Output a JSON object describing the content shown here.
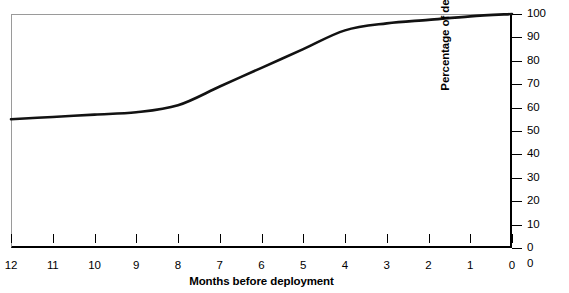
{
  "chart_data": {
    "type": "line",
    "title": "",
    "xlabel": "Months before deployment",
    "ylabel": "Percentage of deployers",
    "x": [
      12,
      11,
      10,
      9,
      8,
      7,
      6,
      5,
      4,
      3,
      2,
      1,
      0
    ],
    "values": [
      55,
      56,
      57,
      58,
      61,
      69,
      77,
      85,
      93,
      96,
      97.5,
      99,
      100
    ],
    "series": [
      {
        "name": "Percentage of deployers",
        "values": [
          55,
          56,
          57,
          58,
          61,
          69,
          77,
          85,
          93,
          96,
          97.5,
          99,
          100
        ]
      }
    ],
    "xlim": [
      12,
      0
    ],
    "ylim": [
      0,
      100
    ],
    "x_tick_labels": [
      "12",
      "11",
      "10",
      "9",
      "8",
      "7",
      "6",
      "5",
      "4",
      "3",
      "2",
      "1",
      "0"
    ],
    "y_tick_labels": [
      "0",
      "10",
      "20",
      "30",
      "40",
      "50",
      "60",
      "70",
      "80",
      "90",
      "100"
    ],
    "y_ticks": [
      0,
      10,
      20,
      30,
      40,
      50,
      60,
      70,
      80,
      90,
      100
    ],
    "y_axis_position": "right",
    "x_axis_direction": "descending",
    "grid": false,
    "legend": "none",
    "line_color": "#121212",
    "line_width": 2.6,
    "frame_color": "#9a9a9a",
    "axis_color": "#000000",
    "origin_extra_label": "0"
  }
}
